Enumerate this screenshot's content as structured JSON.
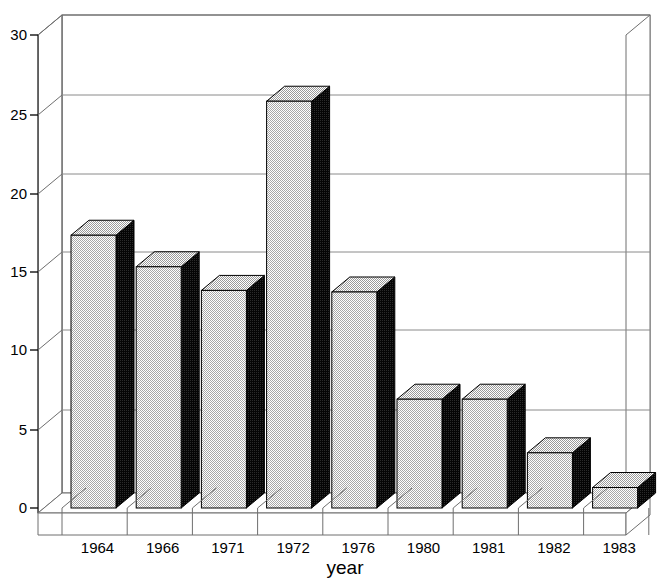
{
  "chart_data": {
    "type": "bar",
    "title": "",
    "subtitle": "",
    "xlabel": "year",
    "ylabel": "",
    "categories": [
      "1964",
      "1966",
      "1971",
      "1972",
      "1976",
      "1980",
      "1981",
      "1982",
      "1983"
    ],
    "values": [
      17.3,
      15.3,
      13.8,
      25.8,
      13.7,
      6.9,
      6.9,
      3.5,
      1.3
    ],
    "ylim": [
      0,
      30
    ],
    "yticks": [
      0,
      5,
      10,
      15,
      20,
      25,
      30
    ],
    "ytick_labels": [
      "0",
      "5",
      "10",
      "15",
      "20",
      "25",
      "30"
    ],
    "xtick_labels": [
      "1964",
      "1966",
      "1971",
      "1972",
      "1976",
      "1980",
      "1981",
      "1982",
      "1983"
    ],
    "grid": true,
    "grid_axis": "y",
    "legend": false,
    "legend_position": "none",
    "style": "3d-bar",
    "annotations": [],
    "series": [
      {
        "name": "",
        "values": [
          17.3,
          15.3,
          13.8,
          25.8,
          13.7,
          6.9,
          6.9,
          3.5,
          1.3
        ]
      }
    ],
    "colors": {
      "bar_front": "#d8d8d8",
      "bar_top": "#dcdcdc",
      "bar_side": "#111111",
      "outline": "#000000",
      "gridline": "#7a7a7a",
      "frame": "#6e6e6e",
      "background": "#ffffff",
      "text": "#000000"
    }
  },
  "axis": {
    "y_label_0": "0",
    "y_label_5": "5",
    "y_label_10": "10",
    "y_label_15": "15",
    "y_label_20": "20",
    "y_label_25": "25",
    "y_label_30": "30",
    "x_title": "year"
  }
}
